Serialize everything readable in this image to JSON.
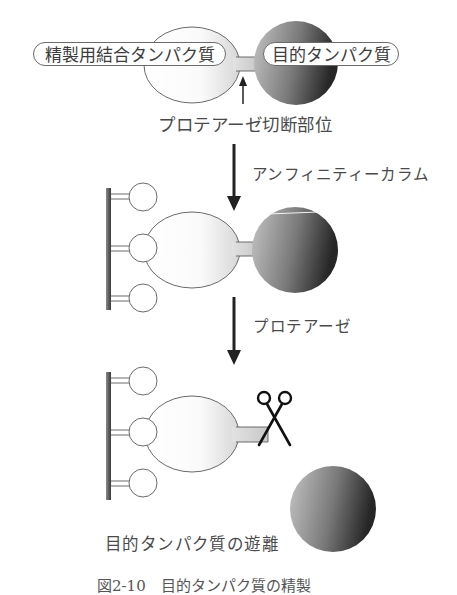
{
  "labels": {
    "binding_protein": "精製用結合タンパク質",
    "target_protein": "目的タンパク質",
    "cleavage_site": "プロテアーゼ切断部位",
    "step1": "アンフィニティーカラム",
    "step2": "プロテアーゼ",
    "release": "目的タンパク質の遊離",
    "caption": "図2-10　目的タンパク質の精製"
  },
  "colors": {
    "outline": "#6a6a6a",
    "target_dark": "#2a2a2a",
    "target_light": "#b8b8b8",
    "column_bar": "#555555",
    "arrow": "#222222"
  }
}
